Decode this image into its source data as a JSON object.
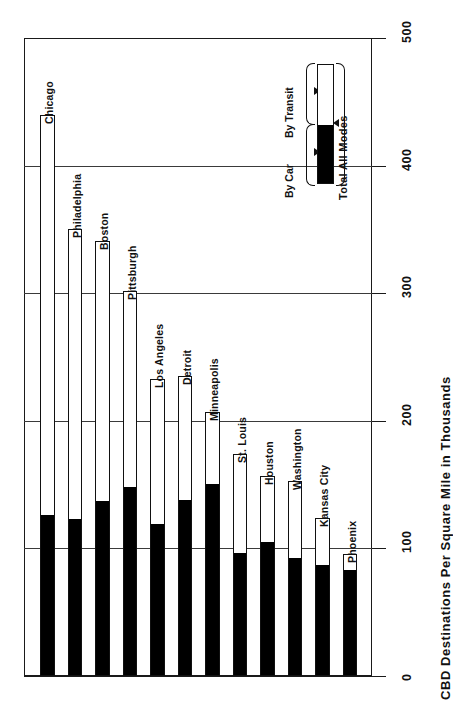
{
  "chart_data": {
    "type": "bar",
    "orientation": "rotated-90",
    "title": "",
    "xlabel": "",
    "ylabel": "CBD Destinations Per Square Mile in Thousands",
    "ylim": [
      0,
      500
    ],
    "ticks": [
      0,
      100,
      200,
      300,
      400,
      500
    ],
    "tick_labels": [
      "0",
      "100",
      "200",
      "300",
      "400",
      "500"
    ],
    "grid": true,
    "stacked": true,
    "legend_position": "inside-upper-right",
    "categories": [
      "Chicago",
      "Philadelphia",
      "Boston",
      "Pittsburgh",
      "Los Angeles",
      "Detroit",
      "Minneapolis",
      "St. Louis",
      "Houston",
      "Washington",
      "Kansas City",
      "Phoenix"
    ],
    "series": [
      {
        "name": "By Car",
        "color": "#000000",
        "values": [
          125,
          122,
          136,
          147,
          118,
          137,
          150,
          96,
          104,
          92,
          86,
          82
        ]
      },
      {
        "name": "By Transit",
        "color": "#ffffff",
        "values": [
          315,
          228,
          205,
          155,
          115,
          98,
          57,
          78,
          53,
          61,
          38,
          14
        ]
      }
    ],
    "totals": [
      440,
      350,
      341,
      302,
      233,
      235,
      207,
      174,
      157,
      153,
      124,
      96
    ]
  },
  "chart": {
    "axis_title": "CBD Destinations Per Square Mile in Thousands",
    "bars": [
      {
        "label": "Chicago",
        "total": 440,
        "car": 125
      },
      {
        "label": "Philadelphia",
        "total": 350,
        "car": 122
      },
      {
        "label": "Boston",
        "total": 341,
        "car": 136
      },
      {
        "label": "Pittsburgh",
        "total": 302,
        "car": 147
      },
      {
        "label": "Los Angeles",
        "total": 233,
        "car": 118
      },
      {
        "label": "Detroit",
        "total": 235,
        "car": 137
      },
      {
        "label": "Minneapolis",
        "total": 207,
        "car": 150
      },
      {
        "label": "St. Louis",
        "total": 174,
        "car": 96
      },
      {
        "label": "Houston",
        "total": 157,
        "car": 104
      },
      {
        "label": "Washington",
        "total": 153,
        "car": 92
      },
      {
        "label": "Kansas City",
        "total": 124,
        "car": 86
      },
      {
        "label": "Phoenix",
        "total": 96,
        "car": 82
      }
    ],
    "tick_labels": [
      "0",
      "100",
      "200",
      "300",
      "400",
      "500"
    ]
  },
  "legend": {
    "by_car": "By Car",
    "by_transit": "By Transit",
    "total_all_modes": "Total All Modes"
  },
  "colors": {
    "car": "#000000",
    "transit": "#ffffff",
    "ink": "#111111",
    "grid": "#3a3a3a",
    "background": "#ffffff"
  }
}
